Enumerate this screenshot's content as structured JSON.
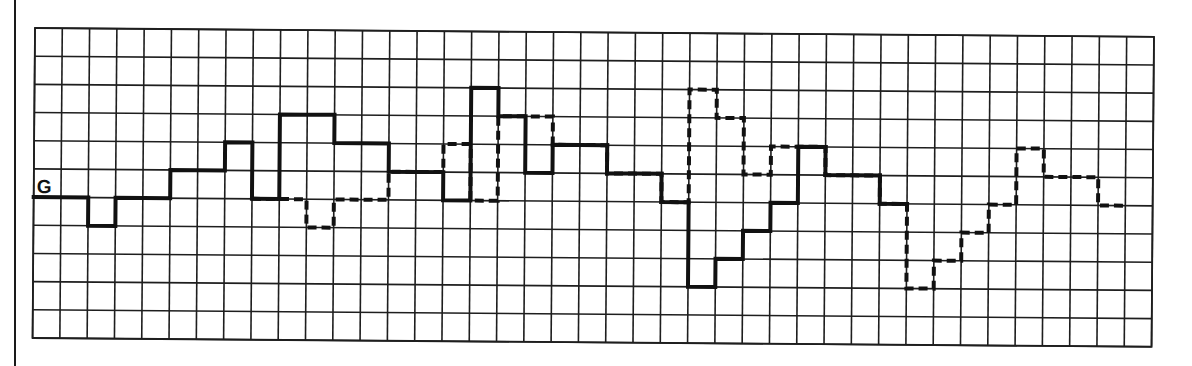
{
  "chart_data": {
    "type": "line",
    "subtype": "step",
    "title": "",
    "xlabel": "",
    "ylabel": "",
    "baseline_label": "G",
    "grid": {
      "on": true,
      "columns": 41,
      "rows": 11,
      "baseline_row_line": 6
    },
    "ylim": [
      -5,
      6
    ],
    "xlim": [
      0,
      41
    ],
    "legend": null,
    "series": [
      {
        "name": "solid",
        "style": "solid",
        "start_col": 0,
        "values": [
          0,
          0,
          -1,
          0,
          0,
          1,
          1,
          2,
          0,
          3,
          3,
          2,
          2,
          1,
          1,
          0,
          4,
          3,
          1,
          2,
          2,
          1,
          1,
          0,
          -3,
          -2,
          -1,
          0,
          2,
          1,
          1,
          0
        ]
      },
      {
        "name": "dashed",
        "style": "dashed",
        "start_col": 8,
        "values": [
          0,
          0,
          -1,
          0,
          0,
          1,
          1,
          2,
          0,
          3,
          3,
          2,
          2,
          1,
          1,
          0,
          4,
          3,
          1,
          2,
          2,
          1,
          1,
          0,
          -3,
          -2,
          -1,
          0,
          2,
          1,
          1,
          0
        ]
      }
    ],
    "colors": {
      "line": "#111111",
      "grid": "#1e1e1e",
      "background": "#ffffff"
    }
  }
}
